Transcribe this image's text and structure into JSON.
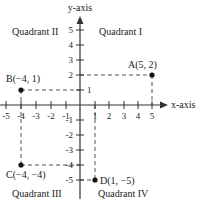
{
  "axes": {
    "x_label": "x-axis",
    "y_label": "y-axis",
    "x_ticks": [
      "-5",
      "-4",
      "-3",
      "-2",
      "-1",
      "1",
      "2",
      "3",
      "4",
      "5"
    ],
    "y_ticks": [
      "5",
      "4",
      "3",
      "2",
      "1",
      "-1",
      "-2",
      "-3",
      "-4",
      "-5"
    ]
  },
  "quadrants": {
    "q1": "Quadrant I",
    "q2": "Quadrant II",
    "q3": "Quadrant III",
    "q4": "Quadrant IV"
  },
  "points": [
    {
      "name": "A",
      "label": "A(5, 2)",
      "x": 5,
      "y": 2
    },
    {
      "name": "B",
      "label": "B(−4, 1)",
      "x": -4,
      "y": 1
    },
    {
      "name": "C",
      "label": "C(−4, −4)",
      "x": -4,
      "y": -4
    },
    {
      "name": "D",
      "label": "D(1, −5)",
      "x": 1,
      "y": -5
    }
  ],
  "colors": {
    "axis": "#333333",
    "dashed": "#555555",
    "point": "#111111",
    "background": "#ffffff"
  }
}
